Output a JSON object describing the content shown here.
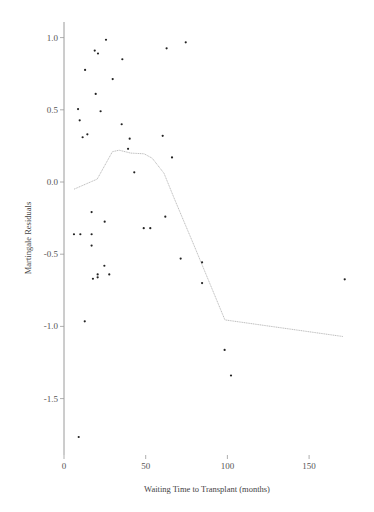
{
  "chart_data": {
    "type": "scatter",
    "title": "",
    "xlabel": "Waiting Time to Transplant (months)",
    "ylabel": "Martingale Residuals",
    "xlim": [
      0,
      178
    ],
    "ylim": [
      -1.85,
      1.1
    ],
    "x_ticks": [
      0,
      50,
      100,
      150
    ],
    "x_tick_labels": [
      "0",
      "50",
      "100",
      "150"
    ],
    "y_ticks": [
      1.0,
      0.5,
      0.0,
      -0.5,
      -1.0,
      -1.5
    ],
    "y_tick_labels": [
      "1.0",
      "0.5",
      "0.0",
      "-0.5",
      "-1.0",
      "-1.5"
    ],
    "grid": false,
    "legend": null,
    "series": [
      {
        "name": "Martingale residuals",
        "type": "scatter",
        "points": [
          [
            25.7,
            0.985
          ],
          [
            18.8,
            0.91
          ],
          [
            20.8,
            0.89
          ],
          [
            35.7,
            0.85
          ],
          [
            62.8,
            0.926
          ],
          [
            74.5,
            0.967
          ],
          [
            12.9,
            0.776
          ],
          [
            29.8,
            0.713
          ],
          [
            19.4,
            0.61
          ],
          [
            8.6,
            0.505
          ],
          [
            22.4,
            0.49
          ],
          [
            9.6,
            0.427
          ],
          [
            35.3,
            0.4
          ],
          [
            14.3,
            0.33
          ],
          [
            11.4,
            0.31
          ],
          [
            40.2,
            0.3
          ],
          [
            60.4,
            0.32
          ],
          [
            39.2,
            0.23
          ],
          [
            66.1,
            0.17
          ],
          [
            43.0,
            0.067
          ],
          [
            16.9,
            -0.208
          ],
          [
            24.9,
            -0.275
          ],
          [
            62.0,
            -0.24
          ],
          [
            6.1,
            -0.362
          ],
          [
            10.0,
            -0.362
          ],
          [
            16.9,
            -0.362
          ],
          [
            48.8,
            -0.32
          ],
          [
            52.8,
            -0.32
          ],
          [
            16.9,
            -0.44
          ],
          [
            71.4,
            -0.53
          ],
          [
            84.5,
            -0.556
          ],
          [
            24.7,
            -0.58
          ],
          [
            20.6,
            -0.64
          ],
          [
            27.7,
            -0.64
          ],
          [
            20.6,
            -0.66
          ],
          [
            17.7,
            -0.67
          ],
          [
            84.5,
            -0.7
          ],
          [
            171.8,
            -0.674
          ],
          [
            12.7,
            -0.965
          ],
          [
            98.3,
            -1.163
          ],
          [
            102.2,
            -1.34
          ],
          [
            9.0,
            -1.766
          ]
        ]
      },
      {
        "name": "Smoothed fit",
        "type": "line",
        "style": "dotted",
        "points": [
          [
            6.1,
            -0.05
          ],
          [
            20.3,
            0.02
          ],
          [
            29.6,
            0.21
          ],
          [
            33.7,
            0.22
          ],
          [
            40.9,
            0.2
          ],
          [
            49.0,
            0.195
          ],
          [
            54.0,
            0.165
          ],
          [
            61.2,
            0.06
          ],
          [
            67.3,
            -0.11
          ],
          [
            80.0,
            -0.45
          ],
          [
            98.5,
            -0.955
          ],
          [
            170.7,
            -1.07
          ]
        ]
      }
    ]
  },
  "colors": {
    "points": "#222222",
    "smooth_line": "#b8b8b8",
    "axis": "#9a9a9a",
    "x_axis_tint": "#7fd3dc"
  }
}
